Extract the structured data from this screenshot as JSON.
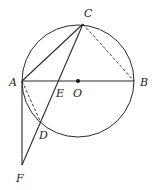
{
  "diagram": {
    "type": "geometry",
    "stroke_color": "#2a2a2a",
    "circle": {
      "center": "O",
      "cx": 78,
      "cy": 81,
      "r": 56
    },
    "points": {
      "A": {
        "x": 22,
        "y": 81,
        "label": "A",
        "lx": 9,
        "ly": 86
      },
      "B": {
        "x": 134,
        "y": 81,
        "label": "B",
        "lx": 140,
        "ly": 86
      },
      "C": {
        "x": 83,
        "y": 24,
        "label": "C",
        "lx": 84,
        "ly": 17
      },
      "O": {
        "x": 78,
        "y": 81,
        "label": "O",
        "lx": 73,
        "ly": 97
      },
      "E": {
        "x": 59,
        "y": 81,
        "label": "E",
        "lx": 56,
        "ly": 97
      },
      "D": {
        "x": 41,
        "y": 123,
        "label": "D",
        "lx": 39,
        "ly": 139
      },
      "F": {
        "x": 22,
        "y": 165,
        "label": "F",
        "lx": 16,
        "ly": 182
      }
    },
    "segments": [
      {
        "from": "A",
        "to": "B",
        "style": "solid"
      },
      {
        "from": "A",
        "to": "C",
        "style": "solid"
      },
      {
        "from": "C",
        "to": "B",
        "style": "dashed"
      },
      {
        "from": "C",
        "to": "F",
        "style": "solid"
      },
      {
        "from": "A",
        "to": "D",
        "style": "dashed"
      },
      {
        "from": "A",
        "to": "F",
        "style": "solid"
      }
    ]
  }
}
